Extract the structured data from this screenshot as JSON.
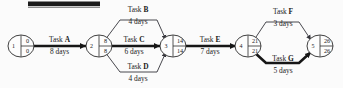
{
  "diagram": {
    "type": "pert-cpm-network",
    "title_bar": "",
    "nodes": [
      {
        "id": "1",
        "earliest": "0",
        "latest": "0",
        "cx": 21,
        "cy": 46
      },
      {
        "id": "2",
        "earliest": "8",
        "latest": "8",
        "cx": 99,
        "cy": 46
      },
      {
        "id": "3",
        "earliest": "14",
        "latest": "14",
        "cx": 173,
        "cy": 46
      },
      {
        "id": "4",
        "earliest": "21",
        "latest": "21",
        "cx": 248,
        "cy": 46
      },
      {
        "id": "5",
        "earliest": "26",
        "latest": "26",
        "cx": 320,
        "cy": 46
      }
    ],
    "tasks": [
      {
        "key": "A",
        "name_prefix": "Task ",
        "letter": "A",
        "duration": "8 days",
        "from": "1",
        "to": "2",
        "critical": true
      },
      {
        "key": "B",
        "name_prefix": "Task ",
        "letter": "B",
        "duration": "4 days",
        "from": "2",
        "to": "3",
        "critical": false
      },
      {
        "key": "C",
        "name_prefix": "Task ",
        "letter": "C",
        "duration": "6 days",
        "from": "2",
        "to": "3",
        "critical": true
      },
      {
        "key": "D",
        "name_prefix": "Task ",
        "letter": "D",
        "duration": "4 days",
        "from": "2",
        "to": "3",
        "critical": false
      },
      {
        "key": "E",
        "name_prefix": "Task ",
        "letter": "E",
        "duration": "7 days",
        "from": "3",
        "to": "4",
        "critical": true
      },
      {
        "key": "F",
        "name_prefix": "Task ",
        "letter": "F",
        "duration": "3 days",
        "from": "4",
        "to": "5",
        "critical": false
      },
      {
        "key": "G",
        "name_prefix": "Task ",
        "letter": "G",
        "duration": "5 days",
        "from": "4",
        "to": "5",
        "critical": true
      }
    ],
    "labels": {
      "task_a_name": "Task ",
      "task_a_letter": "A",
      "task_a_dur": "8 days",
      "task_b_name": "Task ",
      "task_b_letter": "B",
      "task_b_dur": "4 days",
      "task_c_name": "Task ",
      "task_c_letter": "C",
      "task_c_dur": "6 days",
      "task_d_name": "Task ",
      "task_d_letter": "D",
      "task_d_dur": "4 days",
      "task_e_name": "Task ",
      "task_e_letter": "E",
      "task_e_dur": "7 days",
      "task_f_name": "Task ",
      "task_f_letter": "F",
      "task_f_dur": "3 days",
      "task_g_name": "Task ",
      "task_g_letter": "G",
      "task_g_dur": "5 days"
    },
    "node_values": {
      "n1_id": "1",
      "n1_e": "0",
      "n1_l": "0",
      "n2_id": "2",
      "n2_e": "8",
      "n2_l": "8",
      "n3_id": "3",
      "n3_e": "14",
      "n3_l": "14",
      "n4_id": "4",
      "n4_e": "21",
      "n4_l": "21",
      "n5_id": "5",
      "n5_e": "26",
      "n5_l": "26"
    }
  }
}
